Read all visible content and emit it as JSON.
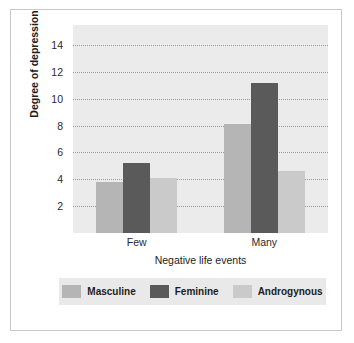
{
  "chart_data": {
    "type": "bar",
    "title": "",
    "subtitle": "",
    "xlabel": "Negative life events",
    "ylabel": "Degree of depression",
    "categories": [
      "Few",
      "Many"
    ],
    "series": [
      {
        "name": "Masculine",
        "color": "#b5b5b5",
        "values": [
          3.8,
          8.1
        ]
      },
      {
        "name": "Feminine",
        "color": "#5a5a5a",
        "values": [
          5.2,
          11.2
        ]
      },
      {
        "name": "Androgynous",
        "color": "#cacaca",
        "values": [
          4.1,
          4.6
        ]
      }
    ],
    "ylim": [
      0,
      15.5
    ],
    "yticks": [
      2,
      4,
      6,
      8,
      10,
      12,
      14
    ],
    "ytick_labels": [
      "2",
      "4",
      "6",
      "8",
      "10",
      "12",
      "14"
    ],
    "grid": "horizontal-dotted",
    "legend_position": "bottom",
    "plot_background": "#ebebeb",
    "figure_background": "#ffffff",
    "figure_border": "#c9c9c9",
    "gridline_color": "#8d8d8d",
    "legend_background": "#e9e9e9"
  }
}
